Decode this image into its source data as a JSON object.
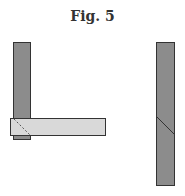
{
  "figure": {
    "title": "Fig. 5",
    "colors": {
      "dark_bar": "#8c8c8c",
      "light_bar": "#d9d9d9",
      "outline": "#333333"
    },
    "parts": [
      {
        "name": "left-vertical-member",
        "description": "vertical dark bar"
      },
      {
        "name": "left-horizontal-member",
        "description": "horizontal light bar with dashed mitre"
      },
      {
        "name": "right-vertical-member",
        "description": "vertical dark bar with diagonal joint"
      }
    ]
  }
}
